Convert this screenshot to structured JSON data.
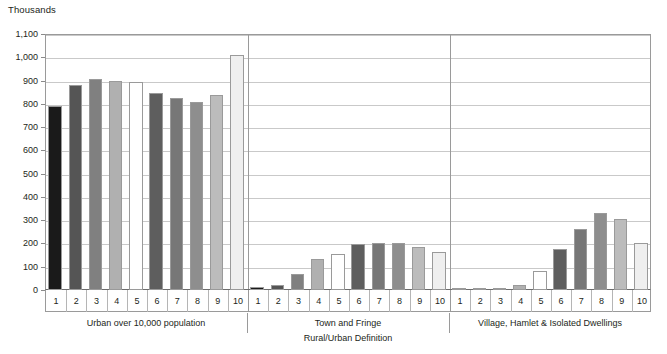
{
  "chart_data": {
    "type": "bar",
    "unit_label": "Thousands",
    "title": "",
    "xlabel": "Rural/Urban Definition",
    "ylabel": "",
    "ylim": [
      0,
      1100
    ],
    "ytick_step": 100,
    "ytick_labels": [
      "0",
      "100",
      "200",
      "300",
      "400",
      "500",
      "600",
      "700",
      "800",
      "900",
      "1,000",
      "1,100"
    ],
    "grid": true,
    "legend": "none",
    "categories": [
      "1",
      "2",
      "3",
      "4",
      "5",
      "6",
      "7",
      "8",
      "9",
      "10"
    ],
    "groups": [
      {
        "label": "Urban over 10,000 population",
        "values": [
          790,
          880,
          905,
          900,
          895,
          845,
          825,
          810,
          840,
          1010
        ]
      },
      {
        "label": "Town and Fringe",
        "values": [
          12,
          22,
          70,
          133,
          155,
          198,
          200,
          200,
          185,
          163
        ]
      },
      {
        "label": "Village, Hamlet & Isolated Dwellings",
        "values": [
          3,
          5,
          8,
          22,
          82,
          175,
          263,
          330,
          305,
          200
        ]
      }
    ],
    "bar_colors": [
      "#1a1a1a",
      "#555555",
      "#808080",
      "#b0b0b0",
      "#ffffff",
      "#5e5e5e",
      "#777777",
      "#8e8e8e",
      "#bcbcbc",
      "#efefef"
    ],
    "bar_border_color": "#9a9a9a"
  }
}
